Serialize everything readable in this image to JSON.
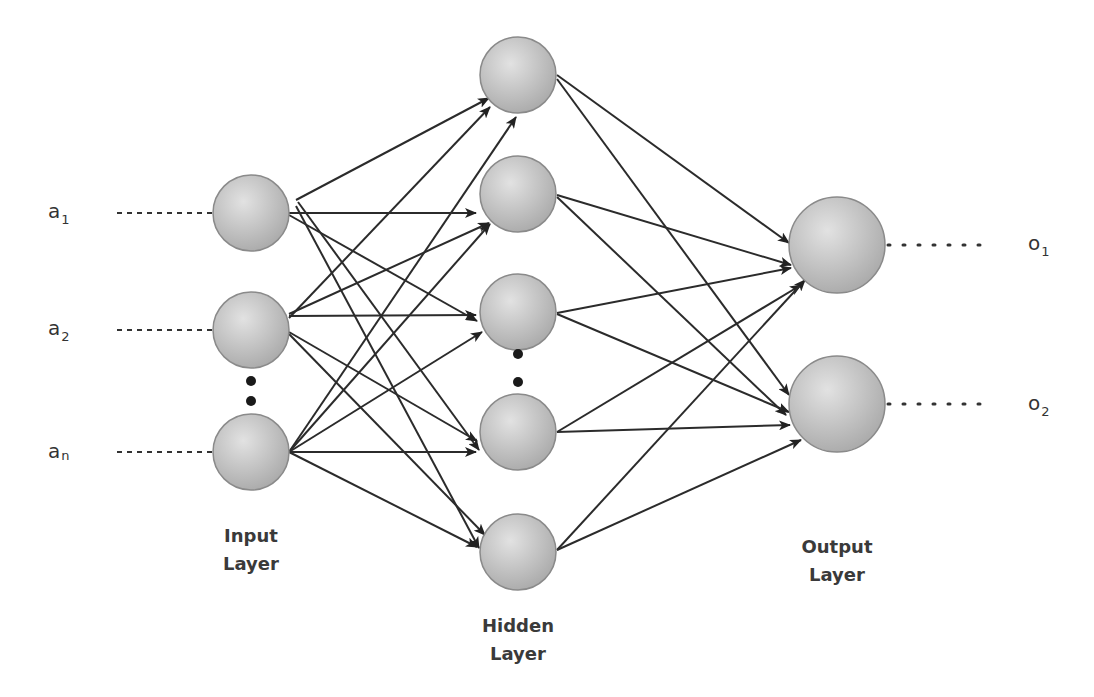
{
  "diagram": {
    "colors": {
      "node_fill_light": "#dcdcdc",
      "node_fill_dark": "#a8a8a8",
      "node_stroke": "#8a8a8a",
      "edge": "#2b2b2b",
      "text": "#333333"
    },
    "inputs": [
      {
        "id": "in1",
        "label": "a",
        "sub": "1",
        "x": 251,
        "y": 213
      },
      {
        "id": "in2",
        "label": "a",
        "sub": "2",
        "x": 251,
        "y": 330
      },
      {
        "id": "inn",
        "label": "a",
        "sub": "n",
        "x": 251,
        "y": 452
      }
    ],
    "hidden": [
      {
        "id": "h1",
        "x": 518,
        "y": 75
      },
      {
        "id": "h2",
        "x": 518,
        "y": 194
      },
      {
        "id": "h3",
        "x": 518,
        "y": 312
      },
      {
        "id": "h4",
        "x": 518,
        "y": 432
      },
      {
        "id": "h5",
        "x": 518,
        "y": 552
      }
    ],
    "outputs": [
      {
        "id": "o1",
        "label": "o",
        "sub": "1",
        "x": 837,
        "y": 245
      },
      {
        "id": "o2",
        "label": "o",
        "sub": "2",
        "x": 837,
        "y": 404
      }
    ],
    "layer_labels": {
      "input": {
        "line1": "Input",
        "line2": "Layer"
      },
      "hidden": {
        "line1": "Hidden",
        "line2": "Layer"
      },
      "output": {
        "line1": "Output",
        "line2": "Layer"
      }
    },
    "ellipsis": {
      "input": "vertical dots between a2 and an",
      "hidden": "vertical dots between hidden nodes 3 and 4"
    }
  }
}
